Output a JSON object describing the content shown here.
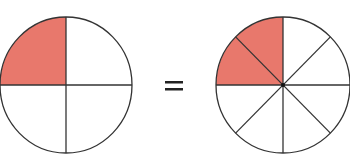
{
  "diagram": {
    "left_circle": {
      "label": "1/4",
      "divisions": 4,
      "shaded_parts": 1,
      "shaded_region": "top-left quadrant"
    },
    "operator": "=",
    "right_circle": {
      "label": "2/8",
      "divisions": 8,
      "shaded_parts": 2,
      "shaded_region": "top-left quadrant (two eighths)"
    },
    "colors": {
      "shade": "#e8786c",
      "stroke": "#333333",
      "background": "#ffffff"
    }
  }
}
